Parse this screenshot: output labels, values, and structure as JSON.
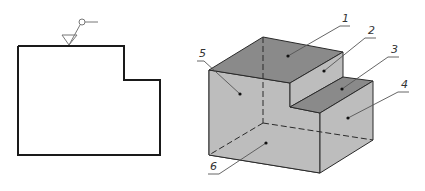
{
  "left_view": {
    "description": "Front view outline of stepped block",
    "surface_symbol": "surface-roughness-symbol"
  },
  "isometric_view": {
    "description": "Isometric view of stepped block with numbered faces",
    "labels": [
      {
        "id": "1",
        "text": "1"
      },
      {
        "id": "2",
        "text": "2"
      },
      {
        "id": "3",
        "text": "3"
      },
      {
        "id": "4",
        "text": "4"
      },
      {
        "id": "5",
        "text": "5"
      },
      {
        "id": "6",
        "text": "6"
      }
    ]
  },
  "colors": {
    "outline": "#1a1a1a",
    "face_dark": "#8a8a8a",
    "face_light": "#bdbdbd",
    "leader": "#555555"
  }
}
